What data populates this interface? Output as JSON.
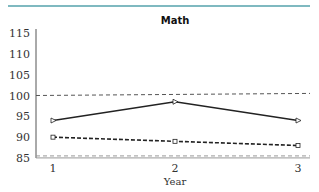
{
  "chart_data": {
    "type": "line",
    "title": "Math",
    "xlabel": "Year",
    "ylabel": "",
    "x": [
      1,
      2,
      3
    ],
    "x_ticks": [
      "1",
      "2",
      "3"
    ],
    "y_ticks": [
      "85",
      "90",
      "95",
      "100",
      "105",
      "110",
      "115"
    ],
    "ylim": [
      85,
      115
    ],
    "series": [
      {
        "name": "solid",
        "style": "solid",
        "marker": "triangle-right",
        "color": "#222222",
        "values": [
          94,
          98.5,
          94
        ]
      },
      {
        "name": "dashed",
        "style": "dashed",
        "marker": "square",
        "color": "#222222",
        "values": [
          90,
          89,
          88
        ]
      }
    ],
    "reference_lines": [
      {
        "name": "upper-reference",
        "style": "dashed",
        "color": "#555555",
        "values": [
          100,
          100.5
        ]
      },
      {
        "name": "lower-reference",
        "style": "dashed",
        "color": "#999999",
        "values": [
          85.5,
          85.5
        ]
      }
    ],
    "grid": false,
    "legend": "none"
  }
}
